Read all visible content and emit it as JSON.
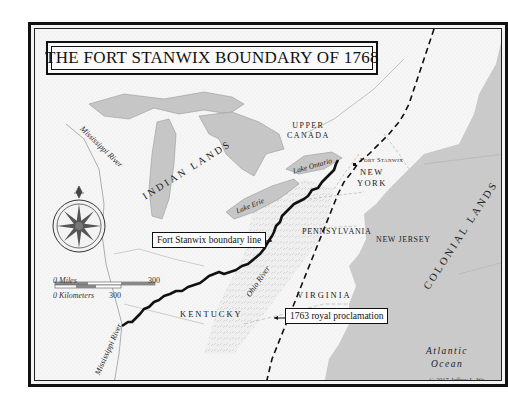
{
  "map": {
    "title": "THE FORT STANWIX BOUNDARY OF 1768",
    "copyright": "© 2017 Jeffrey L. Wa",
    "colors": {
      "land": "#f6f6f6",
      "water": "#c9c9c9",
      "lake": "#c6c6c6",
      "boundary_line": "#111111",
      "border_frame": "#111111"
    },
    "labels": {
      "mississippi_river_north": "Mississippi River",
      "mississippi_river_south": "Mississippi River",
      "indian_lands": "INDIAN LANDS",
      "upper_canada_line1": "UPPER",
      "upper_canada_line2": "CANADA",
      "lake_ontario": "Lake Ontario",
      "lake_erie": "Lake Erie",
      "fort_stanwix": "Fort Stanwix",
      "new_york_line1": "NEW",
      "new_york_line2": "YORK",
      "pennsylvania": "PENNSYLVANIA",
      "new_jersey": "NEW JERSEY",
      "colonial_lands": "COLONIAL LANDS",
      "ohio_river": "Ohio River",
      "kentucky": "KENTUCKY",
      "virginia": "VIRGINIA",
      "atlantic_line1": "Atlantic",
      "atlantic_line2": "Ocean"
    },
    "callouts": {
      "boundary_line": "Fort Stanwix boundary line",
      "proclamation": "1763 royal proclamation"
    },
    "scale_bar": {
      "miles_zero": "0",
      "miles_label": "Miles",
      "miles_max": "300",
      "km_zero": "0",
      "km_label": "Kilometers",
      "km_max": "300"
    },
    "icons": {
      "compass": "compass-rose-icon"
    }
  }
}
